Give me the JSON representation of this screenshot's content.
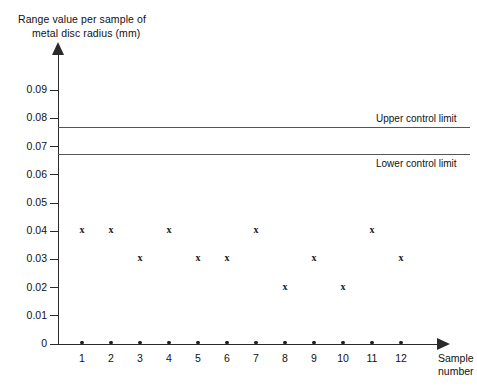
{
  "chart_data": {
    "type": "scatter",
    "title": "Range value per sample of metal disc radius (mm)",
    "title_line1": "Range value per sample of",
    "title_line2": "metal disc radius (mm)",
    "xlabel": "Sample number",
    "xlabel_line1": "Sample",
    "xlabel_line2": "number",
    "ylabel": "Range value per sample of metal disc radius (mm)",
    "categories": [
      1,
      2,
      3,
      4,
      5,
      6,
      7,
      8,
      9,
      10,
      11,
      12
    ],
    "x_tick_labels": [
      "1",
      "2",
      "3",
      "4",
      "5",
      "6",
      "7",
      "8",
      "9",
      "10",
      "11",
      "12"
    ],
    "values": [
      0.04,
      0.04,
      0.03,
      0.04,
      0.03,
      0.03,
      0.04,
      0.02,
      0.03,
      0.02,
      0.04,
      0.03
    ],
    "marker": "x",
    "ylim": [
      0,
      0.095
    ],
    "xlim": [
      0.4,
      12.8
    ],
    "y_tick_values": [
      0,
      0.01,
      0.02,
      0.03,
      0.04,
      0.05,
      0.06,
      0.07,
      0.08,
      0.09
    ],
    "y_tick_labels": [
      "0",
      "0.01",
      "0.02",
      "0.03",
      "0.04",
      "0.05",
      "0.06",
      "0.07",
      "0.08",
      "0.09"
    ],
    "grid": false,
    "legend": "none",
    "annotations": [
      {
        "name": "upper-control-limit",
        "label": "Upper control limit",
        "value": 0.077
      },
      {
        "name": "lower-control-limit",
        "label": "Lower control limit",
        "value": 0.0675
      }
    ],
    "colors": {
      "axis": "#2a2a2a",
      "marker": "#1a1a1a",
      "limit_line": "#555555",
      "background": "#ffffff"
    }
  }
}
